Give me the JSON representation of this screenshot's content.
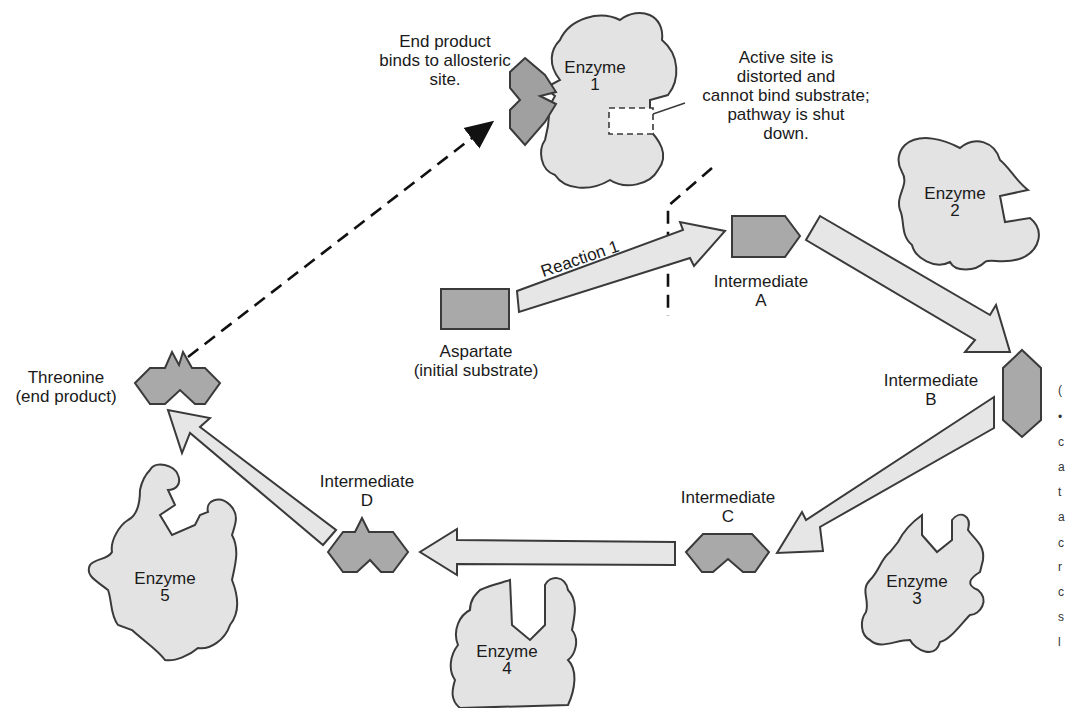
{
  "diagram": {
    "colors": {
      "enzyme_fill": "#e3e3e3",
      "molecule_fill": "#a9a9a9",
      "arrow_fill": "#e6e6e6",
      "outline": "#3a3a3a",
      "background": "#ffffff"
    },
    "annotations": {
      "allosteric": [
        "End product",
        "binds to allosteric",
        "site."
      ],
      "active_site": [
        "Active site is",
        "distorted and",
        "cannot bind substrate;",
        "pathway is shut",
        "down."
      ]
    },
    "enzymes": [
      {
        "id": 1,
        "label": "Enzyme",
        "number": "1"
      },
      {
        "id": 2,
        "label": "Enzyme",
        "number": "2"
      },
      {
        "id": 3,
        "label": "Enzyme",
        "number": "3"
      },
      {
        "id": 4,
        "label": "Enzyme",
        "number": "4"
      },
      {
        "id": 5,
        "label": "Enzyme",
        "number": "5"
      }
    ],
    "molecules": {
      "aspartate": {
        "name": "Aspartate",
        "role": "(initial substrate)"
      },
      "intermediate_a": {
        "name": "Intermediate",
        "letter": "A"
      },
      "intermediate_b": {
        "name": "Intermediate",
        "letter": "B"
      },
      "intermediate_c": {
        "name": "Intermediate",
        "letter": "C"
      },
      "intermediate_d": {
        "name": "Intermediate",
        "letter": "D"
      },
      "threonine": {
        "name": "Threonine",
        "role": "(end product)"
      }
    },
    "reactions": {
      "reaction_1": "Reaction 1"
    },
    "edge_fragments": [
      "(",
      "•",
      "c",
      "a",
      "t",
      "a",
      "c",
      "r",
      "c",
      "s",
      "l"
    ]
  }
}
